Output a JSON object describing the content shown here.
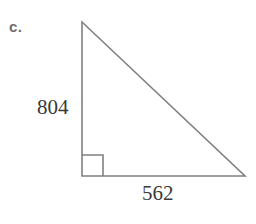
{
  "figure": {
    "part_label": "c.",
    "background_color": "#ffffff",
    "stroke_color": "#808080",
    "label_color": "#3a3a3a",
    "part_label_color": "#6e6e6e",
    "shape": "right-triangle",
    "right_angle_marker": true,
    "vertices": {
      "apex": [
        82,
        22
      ],
      "right_angle": [
        82,
        176
      ],
      "base_right": [
        245,
        176
      ]
    },
    "labels": {
      "vertical_leg": "804",
      "horizontal_leg": "562"
    }
  }
}
